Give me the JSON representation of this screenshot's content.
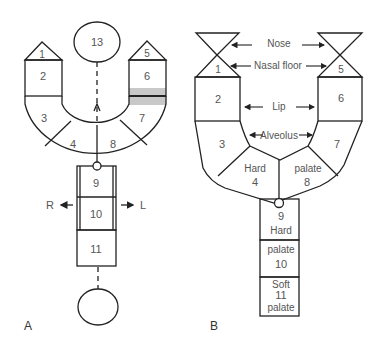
{
  "panel_a": {
    "label": "A",
    "segments": [
      "1",
      "2",
      "3",
      "4",
      "5",
      "6",
      "7",
      "8",
      "9",
      "10",
      "11",
      "13"
    ],
    "direction_left": "R",
    "direction_right": "L",
    "highlight_color": "#c8c8c8"
  },
  "panel_b": {
    "label": "B",
    "segments": [
      "1",
      "2",
      "3",
      "4",
      "5",
      "6",
      "7",
      "8",
      "9",
      "10",
      "11"
    ],
    "annotations": {
      "nose": "Nose",
      "nasal_floor": "Nasal floor",
      "lip": "Lip",
      "alveolus": "Alveolus",
      "hard_left": "Hard",
      "palate_right": "palate",
      "hard_col": "Hard",
      "palate_col": "palate",
      "soft": "Soft",
      "palate_soft": "palate"
    }
  }
}
